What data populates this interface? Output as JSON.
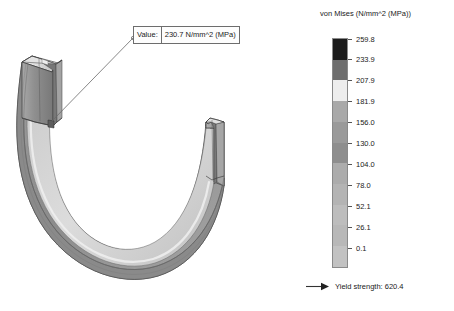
{
  "callout": {
    "label": "Value:",
    "value": "230.7 N/mm^2 (MPa)"
  },
  "legend": {
    "title": "von Mises (N/mm^2 (MPa))",
    "ticks": [
      "259.8",
      "233.9",
      "207.9",
      "181.9",
      "156.0",
      "130.0",
      "104.0",
      "78.0",
      "52.1",
      "26.1",
      "0.1"
    ],
    "band_colors": [
      "#1c1c1c",
      "#6e6e6e",
      "#ededed",
      "#a9a9a9",
      "#9a9a9a",
      "#8e8e8e",
      "#acacac",
      "#b4b4b4",
      "#bdbdbd",
      "#b8b8b8",
      "#c2c2c2"
    ],
    "yield_label": "Yield strength: 620.4",
    "yield_icon": "arrow-right-icon"
  },
  "model": {
    "name": "u-shaped-channel-beam",
    "description": "von Mises stress contour plot on a U-shaped channel section beam",
    "annotation_anchor": "left-arm-web"
  },
  "colors": {
    "background": "#ffffff",
    "outline": "#3a3a3a",
    "callout_border": "#6d6d6d",
    "text": "#1a1a1a"
  }
}
